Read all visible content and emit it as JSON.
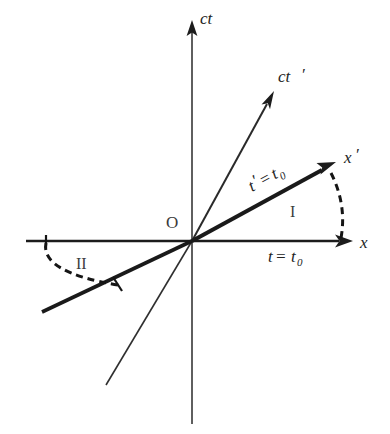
{
  "figure": {
    "background_color": "#ffffff",
    "line_color": "#1c1c1c"
  },
  "axes": {
    "time": {
      "label": "ct",
      "name": "ct-axis",
      "description": "vertical rest-frame time axis"
    },
    "space": {
      "label": "x",
      "name": "x-axis",
      "description": "horizontal rest-frame space axis"
    },
    "time_prime": {
      "label": "ct",
      "prime": "′",
      "name": "ct-prime-axis",
      "description": "boosted frame time axis"
    },
    "space_prime": {
      "label": "x",
      "prime": "′",
      "name": "x-prime-axis",
      "description": "boosted frame space axis"
    }
  },
  "origin": {
    "label": "O"
  },
  "annotations": {
    "simultaneity_prime": {
      "lhs": "t",
      "prime": "′",
      "eq": " = ",
      "rhs": "t",
      "subscript": "0",
      "full": "t′ = t₀"
    },
    "simultaneity_rest": {
      "lhs": "t",
      "eq": " = ",
      "rhs": "t",
      "subscript": "0",
      "full": "t = t₀"
    },
    "region_one": "I",
    "region_two": "II"
  },
  "geometry": {
    "origin_x": 192,
    "origin_y": 241,
    "ct_axis_top_y": 22,
    "ct_axis_bottom_y": 424,
    "x_axis_left": 26,
    "x_axis_right": 350,
    "x_prime_tip_x": 333,
    "x_prime_tip_y": 163,
    "x_prime_ext_x": 42,
    "x_prime_ext_y": 312,
    "ct_prime_tip_x": 273,
    "ct_prime_tip_y": 94,
    "ct_prime_ext_x": 106,
    "ct_prime_ext_y": 385,
    "boost_angle_degrees": 29
  }
}
